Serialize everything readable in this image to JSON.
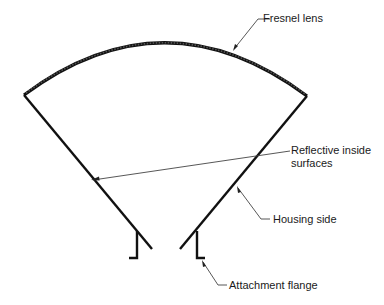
{
  "diagram": {
    "type": "cross-section",
    "labels": {
      "fresnel_lens": "Fresnel lens",
      "reflective_line1": "Reflective inside",
      "reflective_line2": "surfaces",
      "housing_side": "Housing side",
      "attachment_flange": "Attachment flange"
    },
    "colors": {
      "stroke": "#111111",
      "leader": "#444444",
      "background": "#ffffff"
    }
  }
}
